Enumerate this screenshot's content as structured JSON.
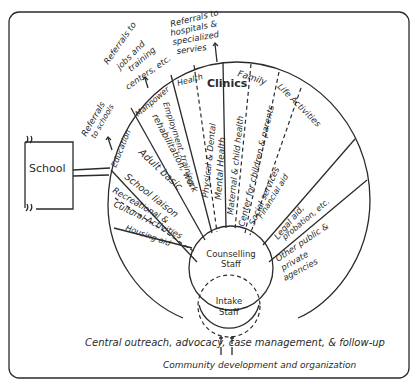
{
  "diagram": {
    "type": "hub-and-spoke service wheel",
    "colors": {
      "ink": "#2b2b2b",
      "paper": "#ffffff"
    },
    "external": {
      "school": "School",
      "referral_schools": [
        "Referrals",
        "to schools"
      ],
      "referral_jobs": [
        "Referrals to",
        "jobs and",
        "training",
        "centers, etc."
      ],
      "referral_hospitals": [
        "Referrals to",
        "hospitals &",
        "specialized",
        "servies"
      ]
    },
    "groups": {
      "education": "Education",
      "manpower": "Manpower",
      "health": "Health",
      "clinics": "Clinics",
      "family": "Family",
      "life_activities": "Life Activities"
    },
    "sectors": {
      "adult_basic": "Adult basic",
      "school_liaison": "School liaison",
      "recreational": "Recreational &",
      "cultural": "Cultural Activities",
      "housing": "Housing aid",
      "employment": "Employment, training,",
      "rehab": "rehabilitation, work",
      "physical_dental": "Physical & Dental",
      "mental_health": "Mental Health",
      "maternal": "Maternal & child health",
      "center_children": "Center for children & parents",
      "social_services": "Social services",
      "financial_aid": "Financial aid",
      "legal_1": "Legal aid,",
      "legal_2": "probation, etc.",
      "other_1": "Other public &",
      "other_2": "private",
      "other_3": "agencies"
    },
    "hub": {
      "counselling_1": "Counselling",
      "counselling_2": "Staff",
      "intake_1": "Intake",
      "intake_2": "Staff"
    },
    "footer": {
      "line1": "Central outreach, advocacy, case management, & follow-up",
      "line2": "Community development and organization"
    }
  }
}
